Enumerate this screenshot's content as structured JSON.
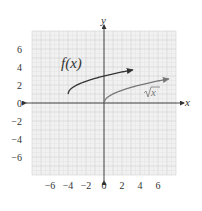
{
  "chart_data": {
    "type": "line",
    "title": "",
    "xlabel": "x",
    "ylabel": "y",
    "xlim": [
      -8,
      8
    ],
    "ylim": [
      -8,
      8
    ],
    "grid": true,
    "x_ticks": [
      -6,
      -4,
      -2,
      0,
      2,
      4,
      6
    ],
    "x_tick_labels": [
      "−6",
      "−4",
      "−2",
      "0",
      "2",
      "4",
      "6"
    ],
    "y_ticks": [
      6,
      4,
      2,
      0,
      -2,
      -4,
      -6
    ],
    "y_tick_labels": [
      "6",
      "4",
      "2",
      "0",
      "−2",
      "−4",
      "−6"
    ],
    "series": [
      {
        "name": "f(x)",
        "label": "f(x)",
        "formula": "sqrt(x+4)+1",
        "x_start": -4,
        "x_end": 3.2,
        "color": "#333333",
        "arrow": true
      },
      {
        "name": "sqrt(x)",
        "label": "x",
        "formula": "sqrt(x)",
        "x_start": 0,
        "x_end": 7.2,
        "color": "#777777",
        "arrow": true
      }
    ],
    "annotations": [
      {
        "text": "f(x)",
        "x": -3.4,
        "y": 4
      },
      {
        "text": "√x",
        "x": 5.2,
        "y": 1
      }
    ]
  }
}
